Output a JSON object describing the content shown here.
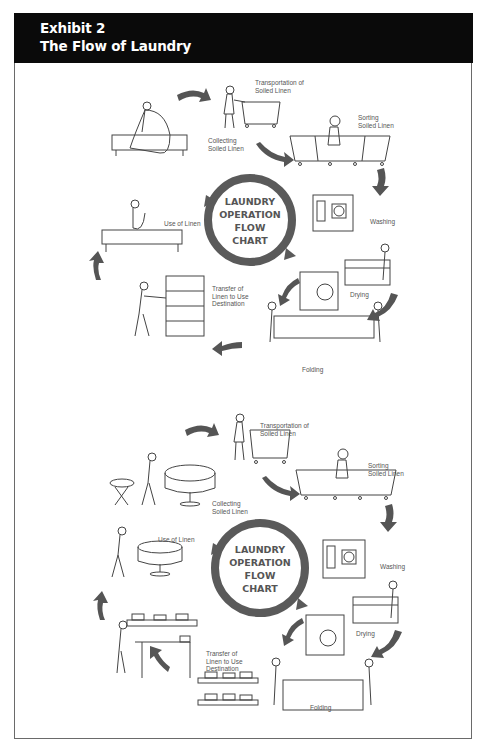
{
  "header": {
    "exhibit": "Exhibit 2",
    "title": "The Flow of Laundry"
  },
  "colors": {
    "header_bg": "#0a0a0a",
    "header_text": "#ffffff",
    "arrow": "#555555",
    "line_art": "#444444",
    "frame": "#6a6a6a"
  },
  "panels": [
    {
      "center": [
        "LAUNDRY",
        "OPERATION",
        "FLOW",
        "CHART"
      ],
      "steps": [
        {
          "id": "collecting",
          "label": "Collecting\nSoiled Linen"
        },
        {
          "id": "transportation",
          "label": "Transportation of\nSoiled Linen"
        },
        {
          "id": "sorting",
          "label": "Sorting\nSoiled Linen"
        },
        {
          "id": "washing",
          "label": "Washing"
        },
        {
          "id": "drying",
          "label": "Drying"
        },
        {
          "id": "folding",
          "label": "Folding"
        },
        {
          "id": "transfer",
          "label": "Transfer of\nLinen to Use\nDestination"
        },
        {
          "id": "use",
          "label": "Use of Linen"
        }
      ]
    },
    {
      "center": [
        "LAUNDRY",
        "OPERATION",
        "FLOW",
        "CHART"
      ],
      "steps": [
        {
          "id": "collecting",
          "label": "Collecting\nSoiled Linen"
        },
        {
          "id": "transportation",
          "label": "Transportation of\nSoiled Linen"
        },
        {
          "id": "sorting",
          "label": "Sorting\nSoiled Linen"
        },
        {
          "id": "washing",
          "label": "Washing"
        },
        {
          "id": "drying",
          "label": "Drying"
        },
        {
          "id": "folding",
          "label": "Folding"
        },
        {
          "id": "transfer",
          "label": "Transfer of\nLinen to Use\nDestination"
        },
        {
          "id": "use",
          "label": "Use of Linen"
        }
      ]
    }
  ]
}
